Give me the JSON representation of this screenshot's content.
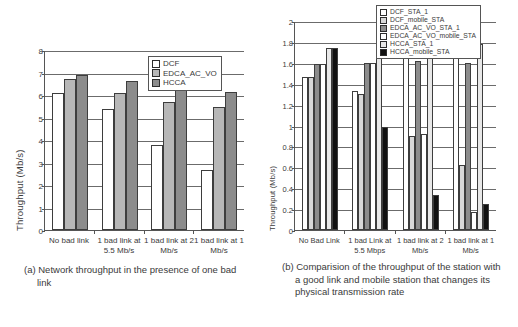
{
  "figure": {
    "panel_a": {
      "caption": "(a) Network throughput in the presence of one bad link",
      "chart_data": {
        "type": "bar",
        "title": "",
        "xlabel": "",
        "ylabel": "Throughput (Mb/s)",
        "ylim": [
          0,
          8
        ],
        "yticks": [
          0,
          1,
          2,
          3,
          4,
          5,
          6,
          7,
          8
        ],
        "grid": true,
        "legend_position": "top-right",
        "categories": [
          "No bad link",
          "1 bad link at 5.5 Mb/s",
          "1 bad link at 2 Mb/s",
          "1 bad link at 1 Mb/s"
        ],
        "series": [
          {
            "name": "DCF",
            "color": "#ffffff",
            "values": [
              6.1,
              5.4,
              3.8,
              2.65
            ]
          },
          {
            "name": "EDCA_AC_VO",
            "color": "#b7b7b7",
            "values": [
              6.7,
              6.1,
              5.68,
              5.46
            ]
          },
          {
            "name": "HCCA",
            "color": "#8c8c8c",
            "values": [
              6.9,
              6.63,
              6.22,
              6.15
            ]
          }
        ]
      }
    },
    "panel_b": {
      "caption": "(b) Comparision of the throughput of the station with a good link and mobile station that changes its physical transmission rate",
      "chart_data": {
        "type": "bar",
        "title": "",
        "xlabel": "",
        "ylabel": "Throughput (Mb/s)",
        "ylim": [
          0,
          2
        ],
        "yticks": [
          0,
          0.2,
          0.4,
          0.6,
          0.8,
          1,
          1.2,
          1.4,
          1.6,
          1.8,
          2
        ],
        "grid": true,
        "legend_position": "top-right",
        "categories": [
          "No Bad Link",
          "1 bad Link at 5.5 Mbps",
          "1 bad link at 2 Mb/s",
          "1 bad link at 1 Mb/s"
        ],
        "series": [
          {
            "name": "DCF_STA_1",
            "color": "#ffffff",
            "values": [
              1.46,
              1.33,
              1.69,
              1.655
            ]
          },
          {
            "name": "DCF_mobile_STA",
            "color": "#d8d8d8",
            "values": [
              1.46,
              1.3,
              0.9,
              0.625
            ]
          },
          {
            "name": "EDCA_AC_VO_STA_1",
            "color": "#8c8c8c",
            "values": [
              1.59,
              1.595,
              1.62,
              1.6
            ]
          },
          {
            "name": "EDCA_AC_VO_mobile_STA",
            "color": "#ffffff",
            "values": [
              1.59,
              1.595,
              0.92,
              0.17
            ]
          },
          {
            "name": "HCCA_STA_1",
            "color": "#e8e8e8",
            "values": [
              1.74,
              1.74,
              1.77,
              1.78
            ]
          },
          {
            "name": "HCCA_mobile_STA",
            "color": "#111111",
            "values": [
              1.74,
              0.985,
              0.335,
              0.245
            ]
          }
        ]
      }
    }
  }
}
